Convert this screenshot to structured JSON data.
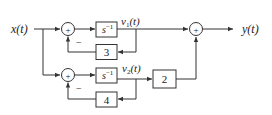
{
  "diagram": {
    "input_label": "x(t)",
    "output_label": "y(t)",
    "signals": {
      "v1": {
        "base": "v",
        "sub": "1",
        "arg": "(t)"
      },
      "v2": {
        "base": "v",
        "sub": "2",
        "arg": "(t)"
      }
    },
    "blocks": {
      "integrator_top": {
        "base": "s",
        "sup": "−1"
      },
      "feedback_top": "3",
      "integrator_bottom": {
        "base": "s",
        "sup": "−1"
      },
      "feedback_bottom": "4",
      "gain": "2"
    },
    "summers": {
      "sum1": {
        "plus": "+",
        "minus": "−"
      },
      "sum2": {
        "plus": "+",
        "minus": "−"
      },
      "sum3": {
        "plus": "+"
      }
    },
    "colors": {
      "line": "#333333",
      "background": "#ffffff"
    }
  }
}
